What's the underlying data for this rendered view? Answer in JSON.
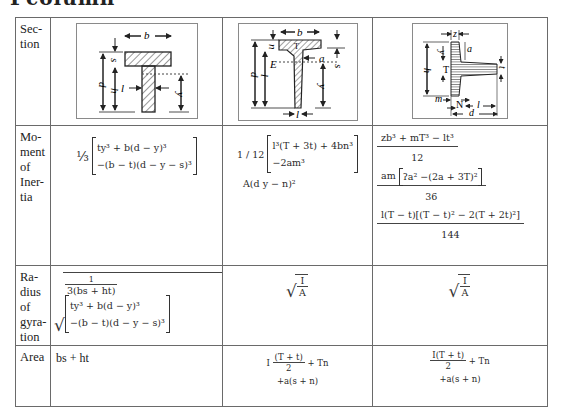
{
  "heading_fragment": "Pcolumn",
  "table": {
    "row_labels": {
      "section": "Sec-\ntion",
      "moment": "Mo-\nment\nof\nIner-\ntia",
      "radius": "Ra-\ndius\nof\ngyra-\ntion",
      "area": "Area"
    },
    "sections": [
      {
        "name": "T-section",
        "dims": {
          "b": "b",
          "s": "s",
          "d": "d",
          "h": "h",
          "l": "l",
          "y": "y"
        },
        "moment": {
          "prefix": "⅓",
          "line1": "ty³ + b(d − y)³",
          "line2": "−(b − t)(d − y − s)³"
        },
        "radius": {
          "frac_num": "1",
          "frac_den": "3(bs + ht)",
          "line1": "ty³ + b(d − y)³",
          "line2": "−(b − t)(d − y − s)³"
        },
        "area": "bs + ht"
      },
      {
        "name": "Tapered T-section",
        "dims": {
          "b": "b",
          "n": "n",
          "d": "d",
          "l": "l",
          "E": "E",
          "a": "a",
          "s": "s",
          "y": "y",
          "T": "T"
        },
        "moment": {
          "prefix": "1 / 12",
          "line1": "l³(T + 3t) + 4bn³",
          "line2": "−2am³",
          "line3": "A(d   y − n)²"
        },
        "radius": {
          "num": "I",
          "den": "A"
        },
        "area": {
          "num": "(T + t)",
          "den": "2",
          "lead": "I",
          "tail": "+ Tn",
          "line2": "+a(s + n)"
        }
      },
      {
        "name": "Rolled T-section",
        "dims": {
          "z": "z",
          "y": "y",
          "a": "a",
          "h": "h",
          "T": "T",
          "t": "t",
          "m": "m",
          "N": "N",
          "l": "l",
          "d": "d"
        },
        "moment": {
          "t1_num": "zb³ + mT³ − lt³",
          "t1_den": "12",
          "t2_prefix": "am",
          "t2_inner": "ʔa² −(2a + 3T)²",
          "t2_den": "36",
          "t3_num": "l(T − t)[(T − t)² − 2(T + 2t)²]",
          "t3_den": "144"
        },
        "radius": {
          "num": "I",
          "den": "A"
        },
        "area": {
          "num": "I(T + t)",
          "den": "2",
          "tail": "+ Tn",
          "line2": "+a(s + n)"
        }
      }
    ]
  }
}
